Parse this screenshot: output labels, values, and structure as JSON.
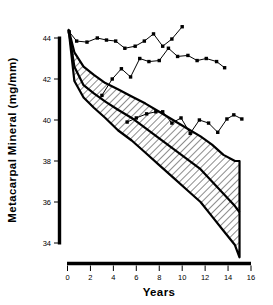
{
  "chart_data": {
    "type": "line",
    "title": "",
    "xlabel": "Years",
    "ylabel": "Metacarpal Mineral (mg/mm)",
    "xlim": [
      0,
      16
    ],
    "ylim": [
      34,
      44
    ],
    "xticks": [
      0,
      2,
      4,
      6,
      8,
      10,
      12,
      14,
      16
    ],
    "xtick_labels": [
      "0",
      "2",
      "4",
      "6",
      "8",
      "10",
      "12",
      "14",
      "16"
    ],
    "yticks": [
      34,
      36,
      38,
      40,
      42,
      44
    ],
    "ytick_labels": [
      "34",
      "36",
      "38",
      "40",
      "42",
      "44"
    ],
    "grid": false,
    "legend": "none",
    "series": [
      {
        "name": "upper-marker-series",
        "marker": "square",
        "x": [
          0.15,
          0.8,
          1.7,
          2.6,
          3.4,
          4.2,
          5.0,
          5.9,
          6.7,
          7.5,
          8.3,
          9.1,
          10.0
        ],
        "values": [
          44.3,
          43.85,
          43.8,
          44.0,
          43.9,
          43.85,
          43.5,
          43.6,
          43.85,
          44.2,
          43.6,
          43.95,
          44.55
        ]
      },
      {
        "name": "middle-marker-series",
        "marker": "square",
        "x": [
          3.0,
          3.9,
          4.7,
          5.5,
          6.3,
          7.1,
          8.0,
          8.8,
          9.6,
          10.5,
          11.3,
          12.1,
          13.0,
          13.7
        ],
        "values": [
          41.2,
          42.0,
          42.5,
          42.1,
          43.0,
          42.85,
          42.9,
          43.5,
          43.1,
          43.15,
          42.9,
          43.0,
          42.85,
          42.55
        ]
      },
      {
        "name": "lower-marker-series",
        "marker": "square",
        "x": [
          5.2,
          6.0,
          6.9,
          7.7,
          8.3,
          9.1,
          9.9,
          10.7,
          11.5,
          12.3,
          13.1,
          13.9,
          14.5,
          15.2
        ],
        "values": [
          39.9,
          40.1,
          40.3,
          40.4,
          40.4,
          39.85,
          40.1,
          39.35,
          40.0,
          39.85,
          39.4,
          40.05,
          40.25,
          40.05
        ]
      }
    ],
    "band": {
      "name": "hatched-confidence-band",
      "hatch": "diagonal",
      "x": [
        0.1,
        0.6,
        1.4,
        2.3,
        3.3,
        4.4,
        5.6,
        6.8,
        8.0,
        9.2,
        10.4,
        11.6,
        12.6,
        13.6,
        14.6,
        15.0
      ],
      "upper": [
        44.4,
        43.3,
        42.6,
        42.2,
        41.8,
        41.5,
        41.15,
        40.8,
        40.4,
        40.0,
        39.6,
        39.2,
        38.8,
        38.3,
        38.0,
        38.0
      ],
      "median": [
        44.4,
        42.6,
        41.7,
        41.3,
        40.9,
        40.5,
        40.1,
        39.6,
        39.1,
        38.6,
        38.1,
        37.6,
        37.0,
        36.4,
        35.8,
        35.5
      ],
      "lower": [
        44.4,
        41.9,
        41.1,
        40.6,
        40.1,
        39.5,
        39.0,
        38.4,
        37.8,
        37.2,
        36.6,
        36.0,
        35.3,
        34.6,
        33.9,
        33.3
      ]
    },
    "annotations": []
  },
  "axes": {
    "y_label": "Metacarpal Mineral (mg/mm)",
    "x_label": "Years"
  }
}
